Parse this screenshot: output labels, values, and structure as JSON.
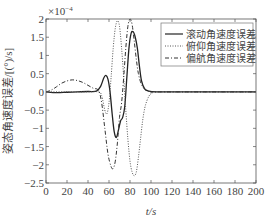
{
  "chart_data": {
    "type": "line",
    "title": "",
    "xlabel": "t/s",
    "ylabel": "姿态角速度误差/[(°)/s]",
    "y_exponent_label": "×10⁻⁴",
    "xlim": [
      0,
      200
    ],
    "ylim": [
      -2.5,
      2
    ],
    "xticks": [
      0,
      20,
      40,
      60,
      80,
      100,
      120,
      140,
      160,
      180,
      200
    ],
    "yticks": [
      2,
      1.5,
      1,
      0.5,
      0,
      -0.5,
      -1,
      -1.5,
      -2,
      -2.5
    ],
    "ytick_labels": [
      "2",
      "1.5",
      "1",
      "0.5",
      "0",
      "−0.5",
      "−1",
      "−1.5",
      "−2",
      "−2.5"
    ],
    "grid": false,
    "legend_position": "upper right",
    "series": [
      {
        "name": "滚动角速度误差",
        "style": "solid",
        "color": "#222222",
        "x": [
          0,
          10,
          20,
          30,
          40,
          48,
          52,
          55,
          57,
          59,
          61,
          63,
          65,
          67,
          69,
          71,
          73,
          75,
          77,
          79,
          81,
          83,
          85,
          87,
          89,
          91,
          94,
          98,
          105,
          120,
          200
        ],
        "y": [
          0,
          -0.02,
          -0.01,
          0,
          0.01,
          0.02,
          0.15,
          0.38,
          0.45,
          0.35,
          0.0,
          -0.6,
          -1.1,
          -1.25,
          -1.05,
          -0.8,
          -0.7,
          -0.4,
          0.4,
          1.2,
          1.6,
          1.65,
          1.5,
          1.2,
          0.7,
          0.3,
          0.08,
          0.02,
          0,
          0,
          0
        ]
      },
      {
        "name": "俯仰角速度误差",
        "style": "dotted",
        "color": "#555555",
        "x": [
          0,
          20,
          40,
          50,
          53,
          56,
          58,
          60,
          62,
          64,
          66,
          68,
          70,
          72,
          74,
          76,
          78,
          80,
          82,
          84,
          86,
          88,
          90,
          92,
          94,
          96,
          98,
          100,
          105,
          120,
          200
        ],
        "y": [
          0,
          0,
          0,
          0,
          -0.1,
          -0.5,
          -0.6,
          -0.3,
          0.4,
          1.2,
          1.75,
          1.95,
          1.8,
          1.2,
          0.4,
          -0.5,
          -1.3,
          -1.9,
          -2.2,
          -2.3,
          -2.2,
          -1.8,
          -1.3,
          -0.8,
          -0.45,
          -0.25,
          -0.12,
          -0.05,
          0,
          0,
          0
        ]
      },
      {
        "name": "偏航角速度误差",
        "style": "dashdot",
        "color": "#333333",
        "x": [
          0,
          5,
          10,
          15,
          20,
          25,
          30,
          35,
          40,
          45,
          50,
          53,
          56,
          59,
          62,
          64,
          66,
          68,
          70,
          72,
          74,
          76,
          78,
          80,
          82,
          84,
          86,
          88,
          91,
          95,
          100,
          110,
          200
        ],
        "y": [
          0,
          0.05,
          0.14,
          0.24,
          0.3,
          0.33,
          0.31,
          0.26,
          0.18,
          0.1,
          0.04,
          -0.3,
          -1.0,
          -1.7,
          -2.05,
          -2.1,
          -1.9,
          -1.4,
          -0.7,
          -0.3,
          0.4,
          1.2,
          1.8,
          2.0,
          1.85,
          1.4,
          0.9,
          0.5,
          0.2,
          0.05,
          0,
          0,
          0
        ]
      }
    ]
  },
  "legend": {
    "items": [
      {
        "label": "滚动角速度误差",
        "style": "solid"
      },
      {
        "label": "俯仰角速度误差",
        "style": "dotted"
      },
      {
        "label": "偏航角速度误差",
        "style": "dashdot"
      }
    ]
  },
  "axes": {
    "xlabel": "t/s",
    "ylabel": "姿态角速度误差/[(°)/s]",
    "y_exponent": "×10",
    "y_exponent_power": "−4"
  }
}
